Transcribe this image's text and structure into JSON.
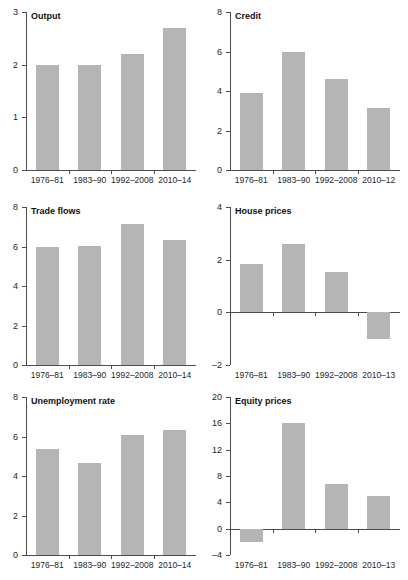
{
  "figure": {
    "background_color": "#ffffff",
    "bar_color": "#b5b5b5",
    "axis_color": "#4d4d4d",
    "text_color": "#262626",
    "layout": "2 columns x 3 rows of small-multiple bar panels"
  },
  "chart_data": [
    {
      "type": "bar",
      "title": "Output",
      "xlabel": "",
      "ylabel": "",
      "categories": [
        "1976–81",
        "1983–90",
        "1992–2008",
        "2010–14"
      ],
      "values": [
        2.0,
        1.99,
        2.2,
        2.7
      ],
      "ylim": [
        0,
        3
      ],
      "yticks": [
        0,
        1,
        2,
        3
      ],
      "ytick_labels": [
        "0",
        "1",
        "2",
        "3"
      ],
      "grid": false,
      "legend": "none"
    },
    {
      "type": "bar",
      "title": "Credit",
      "xlabel": "",
      "ylabel": "",
      "categories": [
        "1976–81",
        "1983–90",
        "1992–2008",
        "2010–12"
      ],
      "values": [
        3.9,
        5.95,
        4.6,
        3.15
      ],
      "ylim": [
        0,
        8
      ],
      "yticks": [
        0,
        2,
        4,
        6,
        8
      ],
      "ytick_labels": [
        "0",
        "2",
        "4",
        "6",
        "8"
      ],
      "grid": false,
      "legend": "none"
    },
    {
      "type": "bar",
      "title": "Trade flows",
      "xlabel": "",
      "ylabel": "",
      "categories": [
        "1976–81",
        "1983–90",
        "1992–2008",
        "2010–14"
      ],
      "values": [
        5.95,
        6.05,
        7.15,
        6.35
      ],
      "ylim": [
        0,
        8
      ],
      "yticks": [
        0,
        2,
        4,
        6,
        8
      ],
      "ytick_labels": [
        "0",
        "2",
        "4",
        "6",
        "8"
      ],
      "grid": false,
      "legend": "none"
    },
    {
      "type": "bar",
      "title": "House prices",
      "xlabel": "",
      "ylabel": "",
      "categories": [
        "1976–81",
        "1983–90",
        "1992–2008",
        "2010–13"
      ],
      "values": [
        1.85,
        2.6,
        1.55,
        -1.0
      ],
      "ylim": [
        -2,
        4
      ],
      "yticks": [
        -2,
        0,
        2,
        4
      ],
      "ytick_labels": [
        "–2",
        "0",
        "2",
        "4"
      ],
      "grid": false,
      "legend": "none"
    },
    {
      "type": "bar",
      "title": "Unemployment rate",
      "xlabel": "",
      "ylabel": "",
      "categories": [
        "1976–81",
        "1983–90",
        "1992–2008",
        "2010–14"
      ],
      "values": [
        5.35,
        4.65,
        6.1,
        6.35
      ],
      "ylim": [
        0,
        8
      ],
      "yticks": [
        0,
        2,
        4,
        6,
        8
      ],
      "ytick_labels": [
        "0",
        "2",
        "4",
        "6",
        "8"
      ],
      "grid": false,
      "legend": "none"
    },
    {
      "type": "bar",
      "title": "Equity prices",
      "xlabel": "",
      "ylabel": "",
      "categories": [
        "1976–81",
        "1983–90",
        "1992–2008",
        "2010–13"
      ],
      "values": [
        -2.0,
        16.0,
        6.8,
        5.0
      ],
      "ylim": [
        -4,
        20
      ],
      "yticks": [
        -4,
        0,
        4,
        8,
        12,
        16,
        20
      ],
      "ytick_labels": [
        "–4",
        "0",
        "4",
        "8",
        "12",
        "16",
        "20"
      ],
      "grid": false,
      "legend": "none"
    }
  ]
}
